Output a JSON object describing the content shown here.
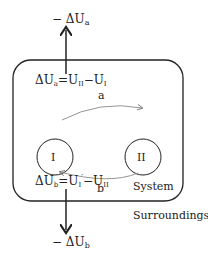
{
  "diagram": {
    "top_label": "− ΔU",
    "top_label_sub": "a",
    "eq_a_lhs": "ΔU",
    "eq_a_lhs_sub": "a",
    "eq_a_rhs": "=U",
    "eq_a_rhs_sub1": "II",
    "eq_a_minus": "−U",
    "eq_a_rhs_sub2": "I",
    "path_a": "a",
    "path_b": "b",
    "state_1": "I",
    "state_2": "II",
    "eq_b_lhs": "ΔU",
    "eq_b_lhs_sub": "b",
    "eq_b_rhs": "=U",
    "eq_b_rhs_sub1": "I",
    "eq_b_prime": "′",
    "eq_b_minus": "−U",
    "eq_b_rhs_sub2": "II",
    "system_label": "System",
    "surroundings_label": "Surroundings",
    "bottom_label": "− ΔU",
    "bottom_label_sub": "b"
  }
}
